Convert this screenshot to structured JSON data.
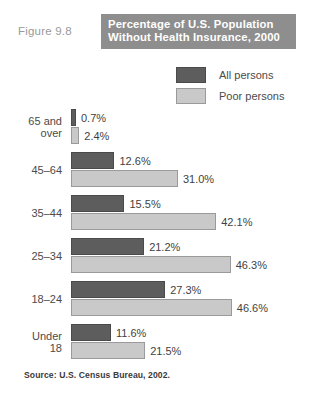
{
  "figure": {
    "number_label": "Figure 9.8",
    "title_line1": "Percentage of U.S. Population",
    "title_line2": "Without Health Insurance, 2000",
    "source": "Source: U.S. Census Bureau, 2002."
  },
  "legend": {
    "items": [
      {
        "label": "All persons",
        "swatch": "dark-swatch",
        "color": "#5d5d5d"
      },
      {
        "label": "Poor persons",
        "swatch": "light-swatch",
        "color": "#c9c9c9"
      }
    ]
  },
  "groups": [
    {
      "label_line1": "65 and",
      "label_line2": "over",
      "bars": [
        {
          "series": "All persons",
          "value": 0.7,
          "value_label": "0.7%"
        },
        {
          "series": "Poor persons",
          "value": 2.4,
          "value_label": "2.4%"
        }
      ]
    },
    {
      "label_line1": "45–64",
      "label_line2": "",
      "bars": [
        {
          "series": "All persons",
          "value": 12.6,
          "value_label": "12.6%"
        },
        {
          "series": "Poor persons",
          "value": 31.0,
          "value_label": "31.0%"
        }
      ]
    },
    {
      "label_line1": "35–44",
      "label_line2": "",
      "bars": [
        {
          "series": "All persons",
          "value": 15.5,
          "value_label": "15.5%"
        },
        {
          "series": "Poor persons",
          "value": 42.1,
          "value_label": "42.1%"
        }
      ]
    },
    {
      "label_line1": "25–34",
      "label_line2": "",
      "bars": [
        {
          "series": "All persons",
          "value": 21.2,
          "value_label": "21.2%"
        },
        {
          "series": "Poor persons",
          "value": 46.3,
          "value_label": "46.3%"
        }
      ]
    },
    {
      "label_line1": "18–24",
      "label_line2": "",
      "bars": [
        {
          "series": "All persons",
          "value": 27.3,
          "value_label": "27.3%"
        },
        {
          "series": "Poor persons",
          "value": 46.6,
          "value_label": "46.6%"
        }
      ]
    },
    {
      "label_line1": "Under",
      "label_line2": "18",
      "bars": [
        {
          "series": "All persons",
          "value": 11.6,
          "value_label": "11.6%"
        },
        {
          "series": "Poor persons",
          "value": 21.5,
          "value_label": "21.5%"
        }
      ]
    }
  ],
  "chart_data": {
    "type": "bar",
    "orientation": "horizontal",
    "title": "Percentage of U.S. Population Without Health Insurance, 2000",
    "figure_number": "Figure 9.8",
    "xlabel": "",
    "ylabel": "",
    "categories": [
      "65 and over",
      "45–64",
      "35–44",
      "25–34",
      "18–24",
      "Under 18"
    ],
    "series": [
      {
        "name": "All persons",
        "color": "#5d5d5d",
        "values": [
          0.7,
          12.6,
          15.5,
          21.2,
          27.3,
          11.6
        ]
      },
      {
        "name": "Poor persons",
        "color": "#c9c9c9",
        "values": [
          2.4,
          31.0,
          42.1,
          46.3,
          46.6,
          21.5
        ]
      }
    ],
    "value_labels": [
      [
        "0.7%",
        "12.6%",
        "15.5%",
        "21.2%",
        "27.3%",
        "11.6%"
      ],
      [
        "2.4%",
        "31.0%",
        "42.1%",
        "46.3%",
        "46.6%",
        "21.5%"
      ]
    ],
    "xlim": [
      0,
      46.6
    ],
    "grid": false,
    "legend_position": "top-right",
    "units": "percent",
    "source": "Source: U.S. Census Bureau, 2002."
  },
  "render": {
    "px_per_percent": 3.45,
    "bar_origin_x": 71
  }
}
